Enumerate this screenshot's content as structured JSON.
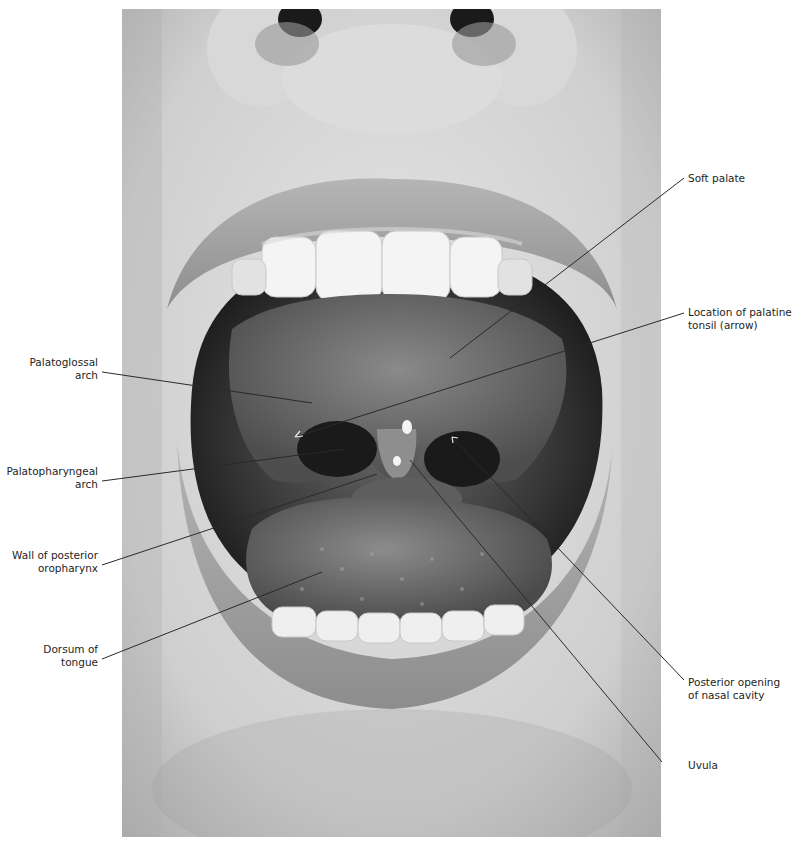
{
  "figure": {
    "type": "anatomical-photograph",
    "photo_tone": "grayscale"
  },
  "labels": {
    "left": [
      {
        "id": "palatoglossal-arch",
        "lines": [
          "Palatoglossal",
          "arch"
        ]
      },
      {
        "id": "palatopharyngeal-arch",
        "lines": [
          "Palatopharyngeal",
          "arch"
        ]
      },
      {
        "id": "wall-posterior-oropharynx",
        "lines": [
          "Wall of posterior",
          "oropharynx"
        ]
      },
      {
        "id": "dorsum-of-tongue",
        "lines": [
          "Dorsum of",
          "tongue"
        ]
      }
    ],
    "right": [
      {
        "id": "soft-palate",
        "lines": [
          "Soft palate"
        ]
      },
      {
        "id": "palatine-tonsil",
        "lines": [
          "Location of palatine",
          "tonsil (arrow)"
        ]
      },
      {
        "id": "posterior-opening-nasal-cavity",
        "lines": [
          "Posterior opening",
          "of nasal cavity"
        ]
      },
      {
        "id": "uvula",
        "lines": [
          "Uvula"
        ]
      }
    ]
  },
  "colors": {
    "leader_line": "#2a2a2a",
    "leader_line_light": "#e8e8e8",
    "label_text": "#1e1e1e",
    "background": "#ffffff"
  }
}
